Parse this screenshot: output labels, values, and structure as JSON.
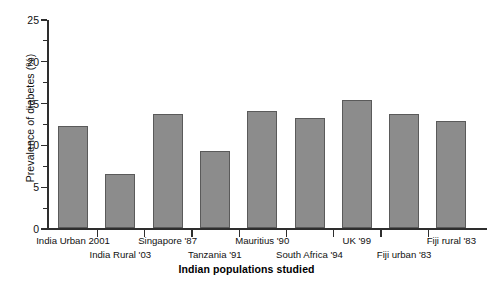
{
  "chart_data": {
    "type": "bar",
    "title": "",
    "xlabel": "Indian populations studied",
    "ylabel": "Prevalence of diabetes (%)",
    "categories": [
      "India Urban 2001",
      "India Rural '03",
      "Singapore '87",
      "Tanzania '91",
      "Mauritius '90",
      "South Africa '94",
      "UK '99",
      "Fiji urban '83",
      "Fiji rural '83"
    ],
    "values": [
      12.2,
      6.5,
      13.6,
      9.2,
      14.0,
      13.2,
      15.3,
      13.6,
      12.8
    ],
    "ylim": [
      0,
      25
    ],
    "yticks": [
      0,
      5,
      10,
      15,
      20,
      25
    ],
    "ytick_labels": [
      "0",
      "5",
      "10",
      "15",
      "20",
      "25"
    ],
    "yminor_ticks": [
      2.5,
      7.5,
      12.5,
      17.5,
      22.5
    ],
    "grid": false,
    "legend": "none",
    "bar_color": "#8c8c8c",
    "bar_edge_color": "#5a5a5a",
    "axis_color": "#2e2e2e",
    "background_color": "#ffffff"
  }
}
